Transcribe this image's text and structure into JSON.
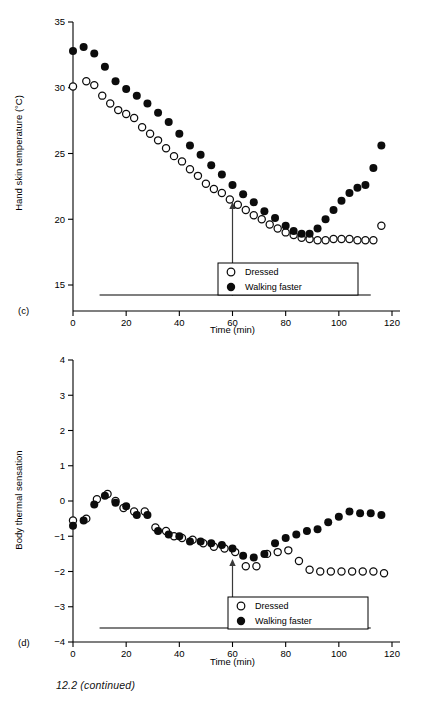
{
  "figure": {
    "caption": "12.2 (continued)"
  },
  "chart_data": [
    {
      "type": "scatter",
      "panel_letter": "(c)",
      "title": "",
      "xlabel": "Time (min)",
      "ylabel": "Hand skin temperature (°C)",
      "xlim": [
        0,
        120
      ],
      "ylim": [
        15,
        35
      ],
      "xticks": [
        0,
        20,
        40,
        60,
        80,
        100,
        120
      ],
      "yticks": [
        15,
        20,
        25,
        30,
        35
      ],
      "grid": false,
      "legend_position": "bottom-right",
      "annotations": [
        {
          "type": "arrow",
          "x": 60,
          "label": "",
          "direction": "up"
        },
        {
          "type": "baseline-bar",
          "x_start": 10,
          "x_end": 112
        }
      ],
      "series": [
        {
          "name": "Dressed",
          "marker": "open-circle",
          "color": "#0c0c0c",
          "x": [
            0,
            5,
            8,
            11,
            14,
            17,
            20,
            23,
            26,
            29,
            32,
            35,
            38,
            41,
            44,
            47,
            50,
            53,
            56,
            59,
            62,
            65,
            68,
            71,
            74,
            77,
            80,
            83,
            86,
            89,
            92,
            95,
            98,
            101,
            104,
            107,
            110,
            113,
            116
          ],
          "y": [
            30.1,
            30.5,
            30.2,
            29.4,
            28.8,
            28.3,
            28.0,
            27.7,
            27.0,
            26.5,
            26.0,
            25.4,
            24.8,
            24.4,
            23.8,
            23.3,
            22.7,
            22.3,
            22.0,
            21.5,
            21.1,
            20.7,
            20.3,
            20.0,
            19.6,
            19.3,
            19.0,
            18.8,
            18.6,
            18.5,
            18.4,
            18.4,
            18.5,
            18.5,
            18.5,
            18.4,
            18.4,
            18.4,
            19.5
          ]
        },
        {
          "name": "Walking faster",
          "marker": "filled-circle",
          "color": "#0c0c0c",
          "x": [
            0,
            4,
            8,
            12,
            16,
            20,
            24,
            28,
            32,
            36,
            40,
            44,
            48,
            52,
            56,
            60,
            64,
            68,
            72,
            76,
            80,
            83,
            86,
            89,
            92,
            95,
            98,
            101,
            104,
            107,
            110,
            113,
            116
          ],
          "y": [
            32.8,
            33.1,
            32.6,
            31.6,
            30.5,
            29.9,
            29.4,
            28.8,
            28.1,
            27.4,
            26.5,
            25.6,
            24.9,
            24.1,
            23.4,
            22.6,
            21.9,
            21.3,
            20.6,
            20.1,
            19.5,
            19.1,
            18.9,
            18.9,
            19.3,
            20.0,
            20.7,
            21.4,
            22.0,
            22.4,
            22.6,
            23.9,
            25.6
          ]
        }
      ]
    },
    {
      "type": "scatter",
      "panel_letter": "(d)",
      "title": "",
      "xlabel": "Time (min)",
      "ylabel": "Body thermal sensation",
      "xlim": [
        0,
        120
      ],
      "ylim": [
        -4,
        4
      ],
      "xticks": [
        0,
        20,
        40,
        60,
        80,
        100,
        120
      ],
      "yticks": [
        -4,
        -3,
        -2,
        -1,
        0,
        1,
        2,
        3,
        4
      ],
      "grid": false,
      "legend_position": "bottom-right",
      "annotations": [
        {
          "type": "arrow",
          "x": 60,
          "label": "",
          "direction": "up"
        },
        {
          "type": "baseline-bar",
          "x_start": 10,
          "x_end": 112
        }
      ],
      "series": [
        {
          "name": "Dressed",
          "marker": "open-circle",
          "color": "#0c0c0c",
          "x": [
            0,
            5,
            9,
            13,
            16,
            19,
            23,
            27,
            31,
            35,
            38,
            41,
            45,
            49,
            53,
            57,
            61,
            65,
            69,
            73,
            77,
            81,
            85,
            89,
            93,
            97,
            101,
            105,
            109,
            113,
            117
          ],
          "y": [
            -0.55,
            -0.5,
            0.05,
            0.2,
            0.0,
            -0.2,
            -0.3,
            -0.3,
            -0.75,
            -0.85,
            -1.0,
            -1.05,
            -1.1,
            -1.2,
            -1.3,
            -1.35,
            -1.45,
            -1.85,
            -1.85,
            -1.5,
            -1.45,
            -1.4,
            -1.7,
            -1.95,
            -2.0,
            -2.0,
            -2.0,
            -2.0,
            -2.0,
            -2.0,
            -2.05
          ]
        },
        {
          "name": "Walking faster",
          "marker": "filled-circle",
          "color": "#0c0c0c",
          "x": [
            0,
            4,
            8,
            12,
            16,
            20,
            24,
            28,
            32,
            36,
            40,
            44,
            48,
            52,
            56,
            60,
            64,
            68,
            72,
            76,
            80,
            84,
            88,
            92,
            96,
            100,
            104,
            108,
            112,
            116
          ],
          "y": [
            -0.7,
            -0.55,
            -0.1,
            0.15,
            -0.05,
            -0.15,
            -0.4,
            -0.4,
            -0.85,
            -0.95,
            -1.0,
            -1.15,
            -1.15,
            -1.2,
            -1.25,
            -1.35,
            -1.55,
            -1.6,
            -1.5,
            -1.2,
            -1.05,
            -0.95,
            -0.85,
            -0.8,
            -0.6,
            -0.45,
            -0.3,
            -0.35,
            -0.35,
            -0.4
          ]
        }
      ]
    }
  ]
}
